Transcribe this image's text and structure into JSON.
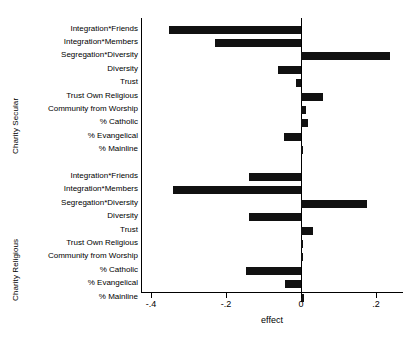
{
  "chart_data": {
    "type": "bar",
    "orientation": "horizontal",
    "title": "",
    "xlabel": "effect",
    "ylabel": "",
    "xlim": [
      -0.44,
      0.265
    ],
    "xticks": [
      -0.4,
      -0.2,
      0,
      0.2
    ],
    "xticklabels": [
      "-.4",
      "-.2",
      "0",
      ".2"
    ],
    "grid": false,
    "legend": null,
    "zero_reference_line": true,
    "bar_color": "#111111",
    "groups": [
      {
        "name": "Charity Secular",
        "categories": [
          "Integration*Friends",
          "Integration*Members",
          "Segregation*Diversity",
          "Diversity",
          "Trust",
          "Trust Own Religious",
          "Community from Worship",
          "% Catholic",
          "% Evangelical",
          "% Mainline"
        ],
        "values": [
          -0.352,
          -0.229,
          0.238,
          -0.061,
          -0.013,
          0.059,
          0.013,
          0.019,
          -0.045,
          0.005
        ]
      },
      {
        "name": "Charity Religious",
        "categories": [
          "Integration*Friends",
          "Integration*Members",
          "Segregation*Diversity",
          "Diversity",
          "Trust",
          "Trust Own Religious",
          "Community from Worship",
          "% Catholic",
          "% Evangelical",
          "% Mainline"
        ],
        "values": [
          -0.139,
          -0.341,
          0.176,
          -0.139,
          0.032,
          0.003,
          0.002,
          -0.147,
          -0.043,
          0.008
        ]
      }
    ]
  }
}
